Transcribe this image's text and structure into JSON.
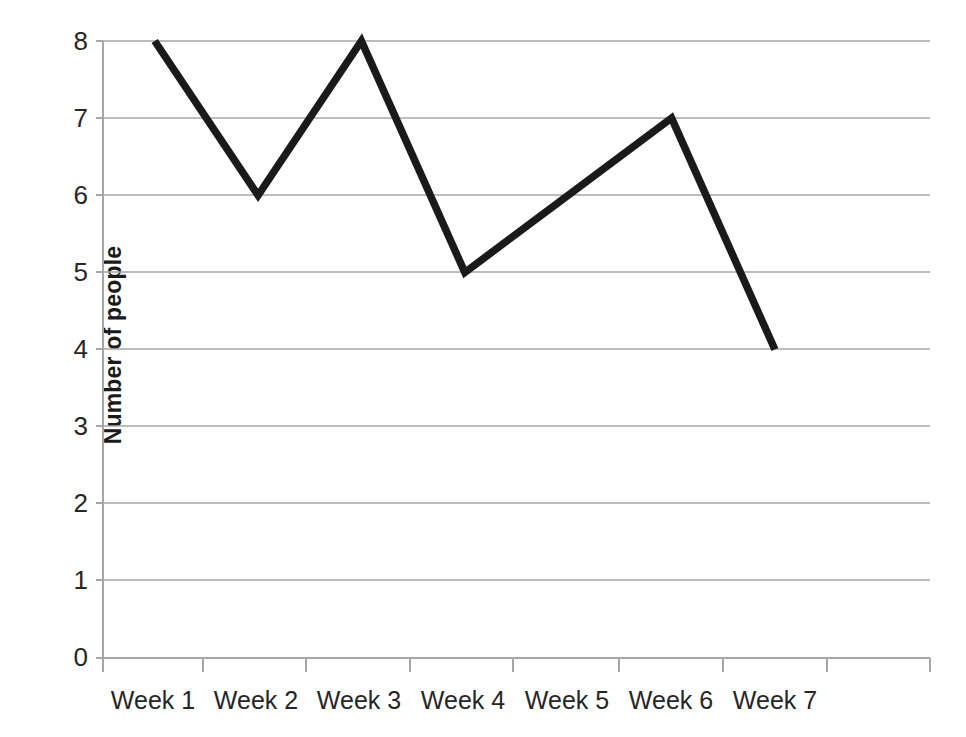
{
  "chart_data": {
    "type": "line",
    "title": "",
    "subtitle": "",
    "xlabel": "",
    "ylabel": "Number of people",
    "categories": [
      "Week 1",
      "Week 2",
      "Week 3",
      "Week 4",
      "Week 5",
      "Week 6",
      "Week 7"
    ],
    "values": [
      8,
      6,
      8,
      5,
      6,
      7,
      4
    ],
    "series": [
      {
        "name": "Number of people",
        "values": [
          8,
          6,
          8,
          5,
          6,
          7,
          4
        ]
      }
    ],
    "ylim": [
      0,
      8
    ],
    "ytick_labels": [
      "8",
      "7",
      "6",
      "5",
      "4",
      "3",
      "2",
      "1",
      "0"
    ],
    "ytick_values": [
      8,
      7,
      6,
      5,
      4,
      3,
      2,
      1,
      0
    ],
    "grid": "horizontal",
    "legend": "none",
    "line_color": "#1a1a1a",
    "grid_color": "#a6a6a6",
    "axis_color": "#a6a6a6",
    "background_color": "#ffffff",
    "markers": "none"
  }
}
